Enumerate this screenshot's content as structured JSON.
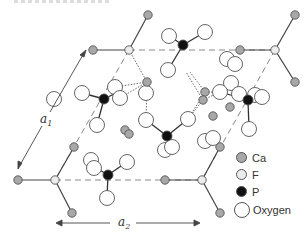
{
  "figure": {
    "title_fragment": ""
  },
  "axes": {
    "a1_label": "a",
    "a1_sub": "1",
    "a2_label": "a",
    "a2_sub": "2"
  },
  "legend": {
    "items": [
      {
        "label": "Ca",
        "color": "#a8a8a8",
        "size": "small"
      },
      {
        "label": "F",
        "color": "#ececec",
        "size": "small"
      },
      {
        "label": "P",
        "color": "#111111",
        "size": "small"
      },
      {
        "label": "Oxygen",
        "color": "#ffffff",
        "size": "big"
      }
    ]
  },
  "colors": {
    "ca": "#a8a8a8",
    "f": "#ececec",
    "p": "#111111",
    "oxygen": "#ffffff",
    "stroke": "#555555"
  },
  "atoms": {
    "ca": [
      [
        148,
        15
      ],
      [
        93,
        50
      ],
      [
        240,
        50
      ],
      [
        295,
        15
      ],
      [
        295,
        82
      ],
      [
        18,
        180
      ],
      [
        74,
        147
      ],
      [
        72,
        213
      ],
      [
        165,
        180
      ],
      [
        220,
        147
      ],
      [
        220,
        213
      ],
      [
        147,
        82
      ],
      [
        205,
        92
      ],
      [
        203,
        100
      ],
      [
        125,
        130
      ],
      [
        129,
        134
      ],
      [
        230,
        107
      ],
      [
        213,
        116
      ]
    ],
    "f": [
      [
        129,
        50
      ],
      [
        275,
        50
      ],
      [
        55,
        180
      ],
      [
        202,
        180
      ]
    ],
    "p": [
      [
        104,
        99
      ],
      [
        183,
        45
      ],
      [
        167,
        136
      ],
      [
        248,
        100
      ],
      [
        108,
        175
      ]
    ],
    "oxygen": [
      [
        82,
        93
      ],
      [
        115,
        87
      ],
      [
        120,
        98
      ],
      [
        97,
        125
      ],
      [
        169,
        36
      ],
      [
        205,
        32
      ],
      [
        168,
        70
      ],
      [
        227,
        59
      ],
      [
        235,
        64
      ],
      [
        231,
        83
      ],
      [
        239,
        94
      ],
      [
        146,
        93
      ],
      [
        146,
        120
      ],
      [
        188,
        119
      ],
      [
        220,
        92
      ],
      [
        255,
        95
      ],
      [
        262,
        97
      ],
      [
        249,
        129
      ],
      [
        165,
        150
      ],
      [
        172,
        147
      ],
      [
        205,
        141
      ],
      [
        213,
        138
      ],
      [
        91,
        160
      ],
      [
        94,
        168
      ],
      [
        127,
        162
      ],
      [
        107,
        198
      ],
      [
        54,
        99
      ]
    ]
  }
}
